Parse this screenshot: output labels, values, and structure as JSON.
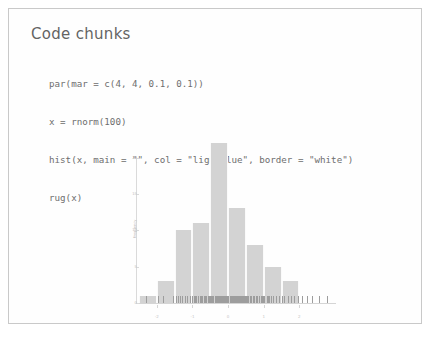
{
  "slide": {
    "title": "Code chunks",
    "border_color": "#c8c8c8",
    "background": "#fefefe"
  },
  "code": {
    "language": "r",
    "lines": [
      "par(mar = c(4, 4, 0.1, 0.1))",
      "x = rnorm(100)",
      "hist(x, main = \"\", col = \"lightblue\", border = \"white\")",
      "rug(x)"
    ]
  },
  "chart_data": {
    "type": "bar",
    "title": "",
    "xlabel": "",
    "ylabel": "Frequency",
    "xlim": [
      -2.5,
      3.0
    ],
    "ylim": [
      0,
      22
    ],
    "bin_width": 0.5,
    "bin_edges": [
      -2.5,
      -2.0,
      -1.5,
      -1.0,
      -0.5,
      0.0,
      0.5,
      1.0,
      1.5,
      2.0
    ],
    "categories": [
      "-2.5",
      "-2.0",
      "-1.5",
      "-1.0",
      "-0.5",
      "0.0",
      "0.5",
      "1.0",
      "1.5"
    ],
    "values": [
      1,
      3,
      10,
      11,
      22,
      13,
      8,
      5,
      3
    ],
    "xticks": [
      -2,
      -1,
      0,
      1,
      2
    ],
    "xtick_labels": [
      "-2",
      "-1",
      "0",
      "1",
      "2"
    ],
    "yticks": [
      0,
      5,
      10,
      15,
      20
    ],
    "ytick_labels": [
      "0",
      "5",
      "10",
      "15",
      "20"
    ],
    "bar_color": "#d2d2d2",
    "bar_border_color": "#fafafa",
    "grid": false,
    "legend": false,
    "rug": true,
    "rug_values": [
      -2.31,
      -1.96,
      -1.82,
      -1.55,
      -1.47,
      -1.41,
      -1.36,
      -1.28,
      -1.21,
      -1.14,
      -1.08,
      -1.02,
      -0.97,
      -0.93,
      -0.89,
      -0.84,
      -0.8,
      -0.76,
      -0.72,
      -0.69,
      -0.65,
      -0.61,
      -0.57,
      -0.54,
      -0.5,
      -0.47,
      -0.44,
      -0.41,
      -0.38,
      -0.35,
      -0.32,
      -0.29,
      -0.26,
      -0.23,
      -0.2,
      -0.17,
      -0.14,
      -0.11,
      -0.08,
      -0.05,
      -0.02,
      0.01,
      0.04,
      0.07,
      0.1,
      0.13,
      0.16,
      0.19,
      0.22,
      0.25,
      0.28,
      0.31,
      0.34,
      0.37,
      0.4,
      0.43,
      0.46,
      0.5,
      0.53,
      0.57,
      0.61,
      0.65,
      0.69,
      0.73,
      0.77,
      0.82,
      0.87,
      0.92,
      0.97,
      1.02,
      1.08,
      1.14,
      1.2,
      1.27,
      1.34,
      1.42,
      1.5,
      1.58,
      1.67,
      1.76,
      1.86,
      1.96,
      2.08,
      2.21,
      2.36,
      2.54,
      2.77,
      -0.44,
      -0.12,
      0.06,
      0.21,
      0.33,
      0.48,
      0.64,
      0.79,
      0.95,
      -0.67,
      -0.31,
      0.15,
      1.12
    ]
  }
}
